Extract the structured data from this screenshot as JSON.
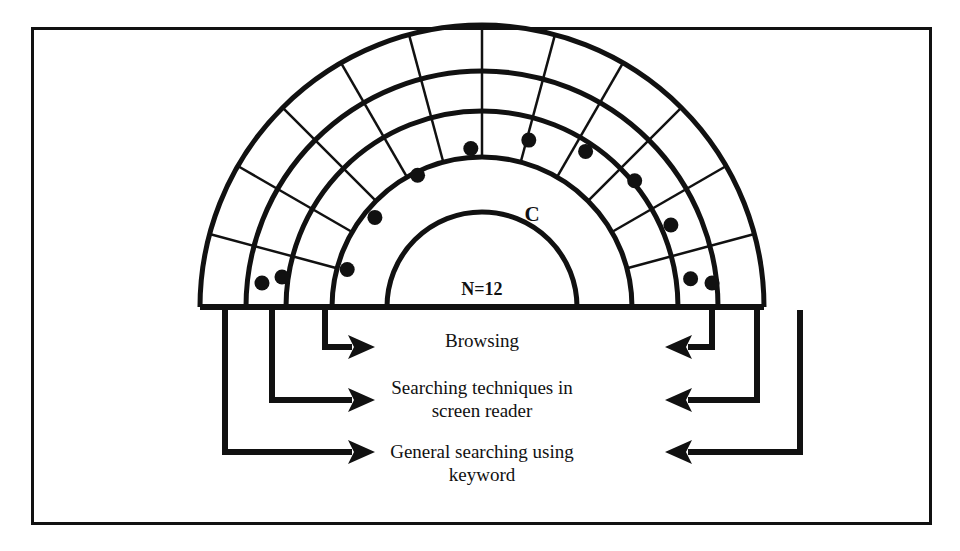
{
  "figure": {
    "type": "concentric-sector-diagram",
    "shape": "semicircle",
    "sector_count": 12,
    "ring_count": 3,
    "center_labels": {
      "middle_ring_label": "C",
      "inner_label": "N=12"
    },
    "dots": {
      "ring": "middle",
      "count": 12,
      "color": "#111111"
    },
    "colors": {
      "stroke": "#111111",
      "fill": "#ffffff",
      "border": "#111111"
    }
  },
  "flows": [
    {
      "id": "browsing",
      "label": "Browsing",
      "label_line_1": "Browsing",
      "label_line_2": ""
    },
    {
      "id": "searching-techniques",
      "label": "Searching techniques in screen reader",
      "label_line_1": "Searching techniques in",
      "label_line_2": "screen reader"
    },
    {
      "id": "general-searching",
      "label": "General searching using keyword",
      "label_line_1": "General searching using",
      "label_line_2": "keyword"
    }
  ],
  "icons": {
    "arrow_right": "arrow-right-icon",
    "arrow_left": "arrow-left-icon"
  }
}
